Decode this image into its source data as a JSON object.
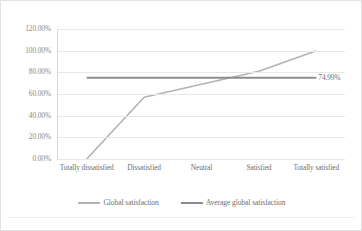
{
  "chart_data": {
    "type": "line",
    "title": "",
    "xlabel": "",
    "ylabel": "",
    "categories": [
      "Totally dissatisfied",
      "Dissatisfied",
      "Neutral",
      "Satisfied",
      "Totally satisfied"
    ],
    "series": [
      {
        "name": "Global satisfaction",
        "color": "#b3b3b3",
        "values": [
          0,
          57,
          69,
          81,
          100
        ]
      },
      {
        "name": "Average global satisfaction",
        "color": "#8c8c8c",
        "values": [
          74.99,
          74.99,
          74.99,
          74.99,
          74.99
        ]
      }
    ],
    "annotations": [
      {
        "text": "74.99%",
        "series": "Average global satisfaction",
        "value": 74.99
      }
    ],
    "ylim": [
      0,
      120
    ],
    "yticks": [
      0,
      20,
      40,
      60,
      80,
      100,
      120
    ],
    "ytick_labels": [
      "0.00%",
      "20.00%",
      "40.00%",
      "60.00%",
      "80.00%",
      "100.00%",
      "120.00%"
    ],
    "grid": true,
    "legend_position": "bottom"
  },
  "legend": {
    "items": [
      {
        "label": "Global satisfaction",
        "color": "#b3b3b3"
      },
      {
        "label": "Average global satisfaction",
        "color": "#8c8c8c"
      }
    ]
  },
  "colors": {
    "frame_border": "#e2e2e2",
    "gridline": "#e8e8e8",
    "axis_line": "#d9d9d9",
    "tick_text": "#6f6f6f",
    "background": "#ffffff"
  }
}
